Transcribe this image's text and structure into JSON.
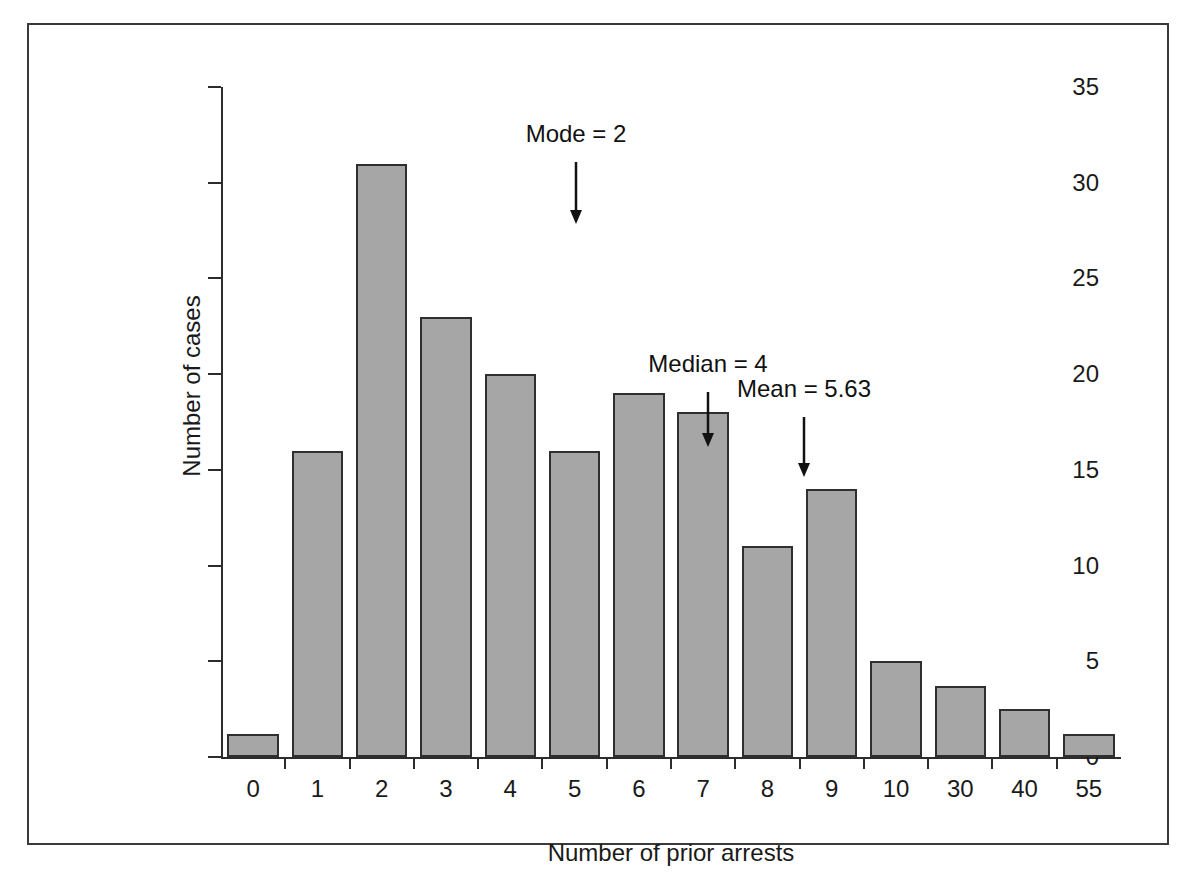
{
  "chart_data": {
    "type": "bar",
    "title": "",
    "xlabel": "Number of prior arrests",
    "ylabel": "Number of cases",
    "categories": [
      "0",
      "1",
      "2",
      "3",
      "4",
      "5",
      "6",
      "7",
      "8",
      "9",
      "10",
      "30",
      "40",
      "55"
    ],
    "values": [
      1.2,
      16,
      31,
      23,
      20,
      16,
      19,
      18,
      11,
      14,
      5,
      3.7,
      2.5,
      1.2
    ],
    "ylim": [
      0,
      35
    ],
    "y_ticks": [
      "0",
      "5",
      "10",
      "15",
      "20",
      "25",
      "30",
      "35"
    ],
    "y_tick_values": [
      0,
      5,
      10,
      15,
      20,
      25,
      30,
      35
    ],
    "grid": false,
    "legend": "none",
    "bar_fill_color": "#a6a6a6",
    "bar_edge_color": "#2f2f2f",
    "annotations": [
      {
        "label": "Mode = 2",
        "category": "2",
        "value": 2,
        "label_x": 355,
        "arrow_top": 75,
        "arrow_height": 62
      },
      {
        "label": "Median = 4",
        "category": "4",
        "value": 4,
        "label_x": 487,
        "arrow_top": 305,
        "arrow_height": 55
      },
      {
        "label": "Mean = 5.63",
        "category": "5.63",
        "value": 5.63,
        "label_x": 583,
        "arrow_top": 330,
        "arrow_height": 60
      }
    ]
  },
  "figure": {
    "frame_color": "#3a3a3a",
    "background": "#ffffff"
  }
}
